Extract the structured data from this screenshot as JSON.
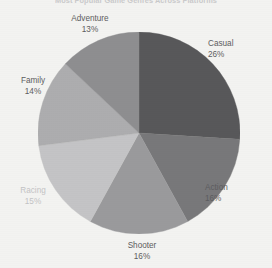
{
  "chart_data": {
    "type": "pie",
    "title": "Most Popular Game Genres Across Platforms",
    "title_visible": false,
    "title_note": "cropped at top edge of image, illegible",
    "categories": [
      "Casual",
      "Action",
      "Shooter",
      "Racing",
      "Family",
      "Adventure"
    ],
    "values": [
      26,
      16,
      16,
      15,
      14,
      13
    ],
    "value_labels": [
      "26%",
      "16%",
      "16%",
      "15%",
      "14%",
      "13%"
    ],
    "unit": "%",
    "total": 100,
    "start_angle_deg": 0,
    "direction": "clockwise",
    "legend": "none",
    "labels_position": "outside",
    "grid": false,
    "xlabel": "",
    "ylabel": "",
    "slices": [
      {
        "name": "Casual",
        "value": 26,
        "pct_label": "26%",
        "color": "#58585a",
        "start_deg": 0,
        "end_deg": 93.6,
        "label_color": "#5d5d60"
      },
      {
        "name": "Action",
        "value": 16,
        "pct_label": "16%",
        "color": "#78787a",
        "start_deg": 93.6,
        "end_deg": 151.2,
        "label_color": "#5d5d60"
      },
      {
        "name": "Shooter",
        "value": 16,
        "pct_label": "16%",
        "color": "#9a9a9c",
        "start_deg": 151.2,
        "end_deg": 208.8,
        "label_color": "#5d5d60"
      },
      {
        "name": "Racing",
        "value": 15,
        "pct_label": "15%",
        "color": "#c4c4c6",
        "start_deg": 208.8,
        "end_deg": 262.8,
        "label_color": "#c3c3c5"
      },
      {
        "name": "Family",
        "value": 14,
        "pct_label": "14%",
        "color": "#adadaf",
        "start_deg": 262.8,
        "end_deg": 313.2,
        "label_color": "#5d5d60"
      },
      {
        "name": "Adventure",
        "value": 13,
        "pct_label": "13%",
        "color": "#8e8e90",
        "start_deg": 313.2,
        "end_deg": 360,
        "label_color": "#5d5d60"
      }
    ],
    "colors": [
      "#58585a",
      "#78787a",
      "#9a9a9c",
      "#c4c4c6",
      "#adadaf",
      "#8e8e90"
    ],
    "background_color": "#f3f3f1"
  }
}
